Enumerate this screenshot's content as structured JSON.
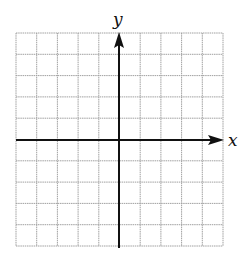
{
  "chart_data": {
    "type": "grid",
    "title": "",
    "xlabel": "x",
    "ylabel": "y",
    "grid": true,
    "grid_columns": 10,
    "grid_rows": 10,
    "xlim": [
      -5,
      5
    ],
    "ylim": [
      -5,
      5
    ],
    "x_axis_arrow": "positive",
    "y_axis_arrow": "positive",
    "series": []
  },
  "labels": {
    "x_axis": "x",
    "y_axis": "y"
  },
  "colors": {
    "grid": "#a0a0a0",
    "axis": "#111111",
    "background": "#ffffff"
  }
}
